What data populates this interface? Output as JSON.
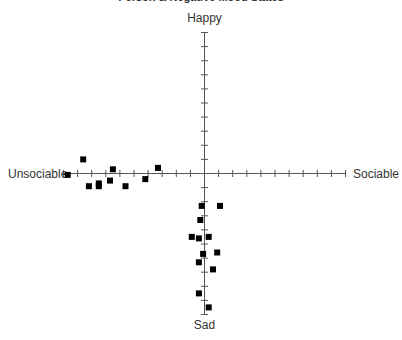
{
  "chart_data": {
    "type": "scatter",
    "title": "Person & Negative Mood States",
    "xlabel": "",
    "ylabel": "",
    "axis_labels": {
      "top": "Happy",
      "bottom": "Sad",
      "left": "Unsociable",
      "right": "Sociable"
    },
    "xlim": [
      -10,
      10
    ],
    "ylim": [
      -10,
      10
    ],
    "tick_step": 1,
    "grid": false,
    "legend": null,
    "marker": "square",
    "marker_color": "#000000",
    "axis_color": "#555555",
    "series": [
      {
        "name": "Moods",
        "points": [
          {
            "x": -9.7,
            "y": -0.1
          },
          {
            "x": -8.6,
            "y": 1.0
          },
          {
            "x": -8.2,
            "y": -0.9
          },
          {
            "x": -7.5,
            "y": -0.7
          },
          {
            "x": -7.5,
            "y": -0.9
          },
          {
            "x": -6.5,
            "y": 0.3
          },
          {
            "x": -6.7,
            "y": -0.5
          },
          {
            "x": -5.6,
            "y": -0.9
          },
          {
            "x": -4.2,
            "y": -0.4
          },
          {
            "x": -3.3,
            "y": 0.4
          },
          {
            "x": -0.2,
            "y": -2.3
          },
          {
            "x": 1.1,
            "y": -2.3
          },
          {
            "x": -0.3,
            "y": -3.3
          },
          {
            "x": -0.9,
            "y": -4.5
          },
          {
            "x": -0.4,
            "y": -4.6
          },
          {
            "x": 0.3,
            "y": -4.5
          },
          {
            "x": -0.1,
            "y": -5.7
          },
          {
            "x": 0.9,
            "y": -5.6
          },
          {
            "x": -0.4,
            "y": -6.3
          },
          {
            "x": 0.6,
            "y": -6.8
          },
          {
            "x": -0.4,
            "y": -8.5
          },
          {
            "x": 0.3,
            "y": -9.5
          }
        ]
      }
    ]
  }
}
